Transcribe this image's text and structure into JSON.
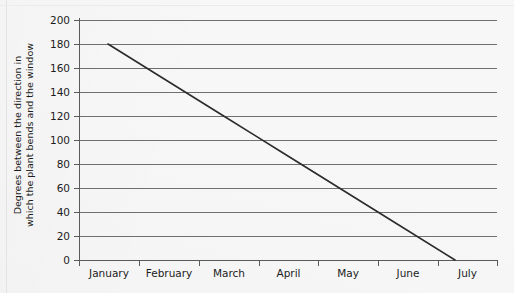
{
  "chart_data": {
    "type": "line",
    "title": "",
    "xlabel": "",
    "ylabel": "Degrees between the direction in which the plant bends and the window",
    "ylabel_lines": [
      "Degrees between the direction in",
      "which the plant bends and the window"
    ],
    "categories": [
      "January",
      "February",
      "March",
      "April",
      "May",
      "June",
      "July"
    ],
    "x": [
      0,
      1,
      2,
      3,
      4,
      5,
      6
    ],
    "series": [
      {
        "name": "plant bend angle",
        "values": [
          180,
          150,
          120,
          90,
          60,
          30,
          0
        ]
      }
    ],
    "ylim": [
      0,
      200
    ],
    "yticks": [
      0,
      20,
      40,
      60,
      80,
      100,
      120,
      140,
      160,
      180,
      200
    ],
    "ytick_labels": [
      "0",
      "20",
      "40",
      "60",
      "80",
      "100",
      "120",
      "140",
      "160",
      "180",
      "200"
    ],
    "grid": true,
    "grid_axis": "y",
    "legend": false,
    "legend_position": "none",
    "line_color": "#2b2b2b",
    "grid_color": "#6f6f6f",
    "axis_color": "#5a5a5a",
    "background_color": "#f7f7f7",
    "text_color": "#1c1c1c",
    "start_point": {
      "x_label": "January",
      "value": 180
    },
    "end_point": {
      "x_label": "July",
      "value": 0
    }
  }
}
